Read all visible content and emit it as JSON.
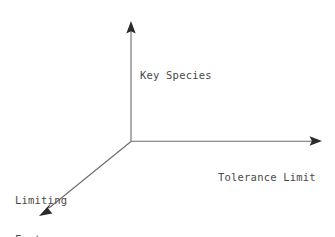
{
  "diagram": {
    "background_color": "#ffffff",
    "line_color": "#6b6b6b",
    "arrow_color": "#2b2b2b",
    "text_color": "#4a4a4a",
    "origin": {
      "x": 131,
      "y": 141
    },
    "axes": [
      {
        "id": "vertical-axis",
        "label": "Key Species",
        "direction": "up",
        "start": {
          "x": 131,
          "y": 141
        },
        "end": {
          "x": 131,
          "y": 22
        },
        "arrowhead": "triangle",
        "label_position": {
          "x": 140,
          "y": 43
        }
      },
      {
        "id": "horizontal-axis",
        "label": "Tolerance Limit",
        "direction": "right",
        "start": {
          "x": 131,
          "y": 141
        },
        "end": {
          "x": 322,
          "y": 141
        },
        "arrowhead": "triangle",
        "label_position": {
          "x": 218,
          "y": 145
        }
      },
      {
        "id": "diagonal-axis",
        "label": "Limiting Factors",
        "label_lines": [
          "Limiting",
          "Factors"
        ],
        "direction": "down-left",
        "start": {
          "x": 131,
          "y": 141
        },
        "end": {
          "x": 39,
          "y": 216
        },
        "arrowhead": "triangle",
        "label_position": {
          "x": 15,
          "y": 168
        }
      }
    ]
  }
}
